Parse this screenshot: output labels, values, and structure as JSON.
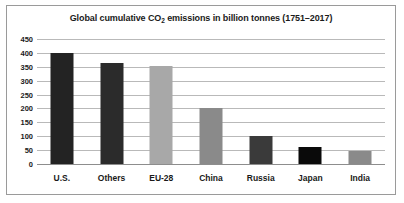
{
  "chart_data": {
    "type": "bar",
    "title": "Global cumulative CO2 emissions in billion tonnes (1751–2017)",
    "title_prefix": "Global cumulative CO",
    "title_subscript": "2",
    "title_suffix": " emissions in billion tonnes (1751–2017)",
    "xlabel": "",
    "ylabel": "",
    "ylim": [
      0,
      450
    ],
    "ytick_step": 50,
    "yticks": [
      450,
      400,
      350,
      300,
      250,
      200,
      150,
      100,
      50,
      0
    ],
    "ytick_labels": [
      "450",
      "400",
      "350",
      "300",
      "250",
      "200",
      "150",
      "100",
      "50",
      "0"
    ],
    "grid": true,
    "legend": false,
    "categories": [
      "U.S.",
      "Others",
      "EU-28",
      "China",
      "Russia",
      "Japan",
      "India"
    ],
    "values": [
      398,
      365,
      353,
      200,
      100,
      60,
      48
    ],
    "bar_colors": [
      "#232323",
      "#2b2b2b",
      "#a8a8a8",
      "#8a8a8a",
      "#3a3a3a",
      "#0a0a0a",
      "#8a8a8a"
    ],
    "bars": [
      {
        "category": "U.S.",
        "value": 398,
        "color": "#232323"
      },
      {
        "category": "Others",
        "value": 365,
        "color": "#2b2b2b"
      },
      {
        "category": "EU-28",
        "value": 353,
        "color": "#a8a8a8"
      },
      {
        "category": "China",
        "value": 200,
        "color": "#8a8a8a"
      },
      {
        "category": "Russia",
        "value": 100,
        "color": "#3a3a3a"
      },
      {
        "category": "Japan",
        "value": 60,
        "color": "#0a0a0a"
      },
      {
        "category": "India",
        "value": 48,
        "color": "#8a8a8a"
      }
    ],
    "colors": {
      "background": "#ffffff",
      "frame_border": "#9a9a9a",
      "gridline": "#b9b9b9",
      "axis": "#8d8d8d",
      "text": "#1a1a1a"
    }
  }
}
